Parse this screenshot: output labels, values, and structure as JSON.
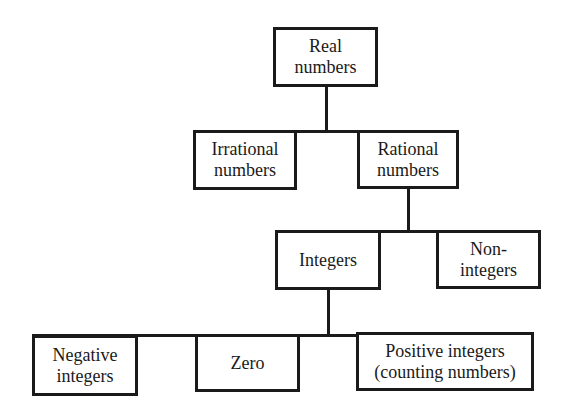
{
  "diagram": {
    "colors": {
      "stroke": "#1a1a1a",
      "fill": "#ffffff",
      "text": "#1a1a1a"
    },
    "nodes": {
      "real": {
        "lines": [
          "Real",
          "numbers"
        ]
      },
      "irrational": {
        "lines": [
          "Irrational",
          "numbers"
        ]
      },
      "rational": {
        "lines": [
          "Rational",
          "numbers"
        ]
      },
      "integers": {
        "lines": [
          "Integers"
        ]
      },
      "non_integers": {
        "lines": [
          "Non-",
          "integers"
        ]
      },
      "negative": {
        "lines": [
          "Negative",
          "integers"
        ]
      },
      "zero": {
        "lines": [
          "Zero"
        ]
      },
      "positive": {
        "lines": [
          "Positive integers",
          "(counting numbers)"
        ]
      }
    },
    "edges": [
      {
        "from": "real",
        "to": [
          "irrational",
          "rational"
        ]
      },
      {
        "from": "rational",
        "to": [
          "integers",
          "non_integers"
        ]
      },
      {
        "from": "integers",
        "to": [
          "negative",
          "zero",
          "positive"
        ]
      }
    ]
  }
}
